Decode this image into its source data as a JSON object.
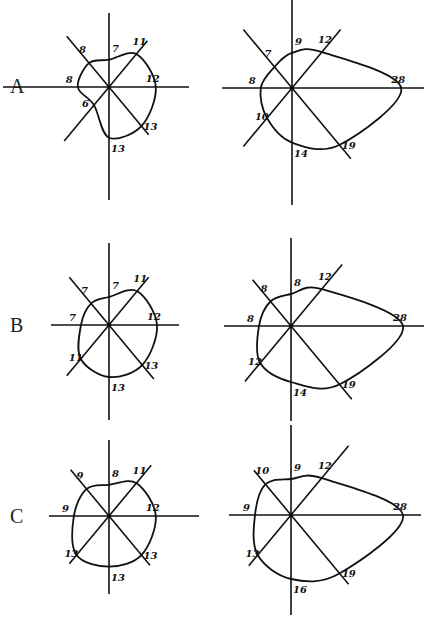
{
  "figure": {
    "rows": [
      {
        "label": "A",
        "diagrams": [
          {
            "id": "A-left",
            "radii": {
              "up": 7,
              "up_right": 11,
              "right": 12,
              "down_right": 13,
              "down": 13,
              "down_left": 6,
              "left": 8,
              "up_left": 8
            },
            "labels": {
              "up": "7",
              "up_right": "11",
              "right": "12",
              "down_right": "13",
              "down": "13",
              "down_left": "6",
              "left": "8",
              "up_left": "8"
            }
          },
          {
            "id": "A-right",
            "radii": {
              "up": 9,
              "up_right": 12,
              "right": 28,
              "down_right": 19,
              "down": 14,
              "down_left": 10,
              "left": 8,
              "up_left": 7
            },
            "labels": {
              "up": "9",
              "up_right": "12",
              "right": "28",
              "down_right": "19",
              "down": "14",
              "down_left": "10",
              "left": "8",
              "up_left": "7"
            }
          }
        ]
      },
      {
        "label": "B",
        "diagrams": [
          {
            "id": "B-left",
            "radii": {
              "up": 7,
              "up_right": 11,
              "right": 12,
              "down_right": 13,
              "down": 13,
              "down_left": 11,
              "left": 7,
              "up_left": 7
            },
            "labels": {
              "up": "7",
              "up_right": "11",
              "right": "12",
              "down_right": "13",
              "down": "13",
              "down_left": "11",
              "left": "7",
              "up_left": "7"
            }
          },
          {
            "id": "B-right",
            "radii": {
              "up": 8,
              "up_right": 12,
              "right": 28,
              "down_right": 19,
              "down": 14,
              "down_left": 12,
              "left": 8,
              "up_left": 8
            },
            "labels": {
              "up": "8",
              "up_right": "12",
              "right": "28",
              "down_right": "19",
              "down": "14",
              "down_left": "12",
              "left": "8",
              "up_left": "8"
            }
          }
        ]
      },
      {
        "label": "C",
        "diagrams": [
          {
            "id": "C-left",
            "radii": {
              "up": 8,
              "up_right": 11,
              "right": 12,
              "down_right": 13,
              "down": 13,
              "down_left": 13,
              "left": 9,
              "up_left": 9
            },
            "labels": {
              "up": "8",
              "up_right": "11",
              "right": "12",
              "down_right": "13",
              "down": "13",
              "down_left": "13",
              "left": "9",
              "up_left": "9"
            }
          },
          {
            "id": "C-right",
            "radii": {
              "up": 9,
              "up_right": 12,
              "right": 28,
              "down_right": 19,
              "down": 16,
              "down_left": 13,
              "left": 9,
              "up_left": 10
            },
            "labels": {
              "up": "9",
              "up_right": "12",
              "right": "28",
              "down_right": "19",
              "down": "16",
              "down_left": "13",
              "left": "9",
              "up_left": "10"
            }
          }
        ]
      }
    ]
  }
}
